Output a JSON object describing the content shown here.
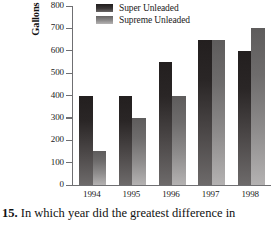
{
  "caption": {
    "number": "15.",
    "text": "In which year did the greatest difference in"
  },
  "legend": {
    "position": "top-center",
    "items": [
      {
        "label": "Super Unleaded",
        "color": "#2a2626",
        "swatch": "super-swatch"
      },
      {
        "label": "Supreme Unleaded",
        "color": "#8c8a8a",
        "swatch": "supreme-swatch"
      }
    ]
  },
  "chart_data": {
    "type": "bar",
    "title": "",
    "xlabel": "",
    "ylabel": "Gallons of Gasoline (in thousands)",
    "categories": [
      "1994",
      "1995",
      "1996",
      "1997",
      "1998"
    ],
    "series": [
      {
        "name": "Super Unleaded",
        "values": [
          400,
          400,
          550,
          650,
          600
        ],
        "color": "#2a2626"
      },
      {
        "name": "Supreme Unleaded",
        "values": [
          150,
          300,
          400,
          650,
          700
        ],
        "color": "#8c8a8a"
      }
    ],
    "ylim": [
      0,
      800
    ],
    "ytick_values": [
      0,
      100,
      200,
      300,
      400,
      500,
      600,
      700,
      800
    ],
    "ytick_labels": [
      "0",
      "100",
      "200",
      "300",
      "400",
      "500",
      "600",
      "700",
      "800"
    ],
    "grid": false,
    "legend_position": "top-center"
  }
}
